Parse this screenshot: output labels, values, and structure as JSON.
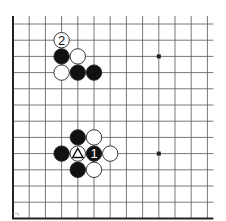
{
  "diagram": {
    "type": "go-board-fragment",
    "grid": {
      "origin_x": 13,
      "origin_y": 24,
      "spacing": 16.2,
      "cols": 13,
      "rows": 12,
      "top_extend": 8,
      "right_extend": 6,
      "edges": [
        "left",
        "bottom"
      ]
    },
    "colors": {
      "line": "#555555",
      "edge": "#222222",
      "black_stone": "#111111",
      "white_stone": "#ffffff",
      "stone_outline": "#222222"
    },
    "star_points": [
      {
        "col": 9,
        "row": 2
      },
      {
        "col": 9,
        "row": 8
      }
    ],
    "stones": [
      {
        "col": 3,
        "row": 1,
        "color": "white",
        "label": "2"
      },
      {
        "col": 3,
        "row": 2,
        "color": "black",
        "label": ""
      },
      {
        "col": 4,
        "row": 2,
        "color": "white",
        "label": ""
      },
      {
        "col": 3,
        "row": 3,
        "color": "white",
        "label": ""
      },
      {
        "col": 4,
        "row": 3,
        "color": "black",
        "label": ""
      },
      {
        "col": 5,
        "row": 3,
        "color": "black",
        "label": ""
      },
      {
        "col": 4,
        "row": 7,
        "color": "black",
        "label": ""
      },
      {
        "col": 5,
        "row": 7,
        "color": "white",
        "label": ""
      },
      {
        "col": 3,
        "row": 8,
        "color": "black",
        "label": ""
      },
      {
        "col": 4,
        "row": 8,
        "color": "white",
        "label": "triangle"
      },
      {
        "col": 5,
        "row": 8,
        "color": "black",
        "label": "1"
      },
      {
        "col": 6,
        "row": 8,
        "color": "white",
        "label": ""
      },
      {
        "col": 4,
        "row": 9,
        "color": "black",
        "label": ""
      },
      {
        "col": 5,
        "row": 9,
        "color": "white",
        "label": ""
      }
    ],
    "caption": "ᄀ"
  }
}
